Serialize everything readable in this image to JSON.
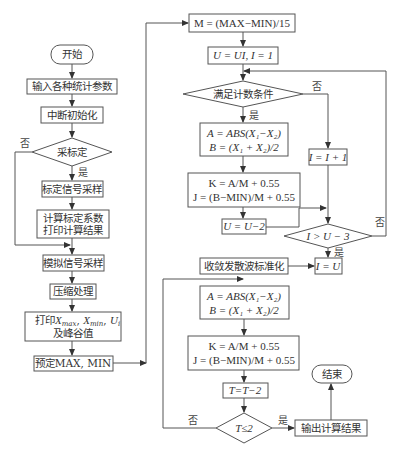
{
  "left_column": {
    "start": "开始",
    "input_params": "输入各种统计参数",
    "interrupt_init": "中断初始化",
    "calibrate_decision": "采标定",
    "calib_no": "否",
    "calib_yes": "是",
    "calib_sample": "标定信号采样",
    "calc_coeff_line1": "计算标定系数",
    "calc_coeff_line2": "打印计算结果",
    "analog_sample": "模拟信号采样",
    "compress": "压缩处理",
    "print_line1_prefix": "打印",
    "print_xmax": "X",
    "print_xmax_sub": "max",
    "print_xmin": "X",
    "print_xmin_sub": "min",
    "print_ui": "U",
    "print_ui_sub": "i",
    "print_line2": "及峰谷值",
    "preset": "预定MAX, MIN"
  },
  "right_column": {
    "m_formula": "M = (MAX−MIN)/15",
    "u_init": "U = UI, I = 1",
    "count_condition": "满足计数条件",
    "count_no": "否",
    "count_yes": "是",
    "a_formula": "A = ABS(X₁−X₂)",
    "b_formula": "B = (X₁ + X₂)/2",
    "k_formula": "K = A/M + 0.55",
    "j_formula": "J = (B−MIN)/M + 0.55",
    "u_minus": "U = U−2",
    "i_plus": "I = I + 1",
    "i_compare": "I > U − 3",
    "compare_no": "否",
    "compare_yes": "是",
    "i_equals_u": "I = U",
    "normalize": "收敛发散波标准化",
    "a_formula2": "A = ABS(X₁−X₂)",
    "b_formula2": "B = (X₁ + X₂)/2",
    "k_formula2": "K = A/M + 0.55",
    "j_formula2": "J = (B−MIN)/M + 0.55",
    "t_minus": "T=T−2",
    "t_compare": "T≤2",
    "t_no": "否",
    "t_yes": "是",
    "output": "输出计算结果",
    "end": "结束"
  }
}
